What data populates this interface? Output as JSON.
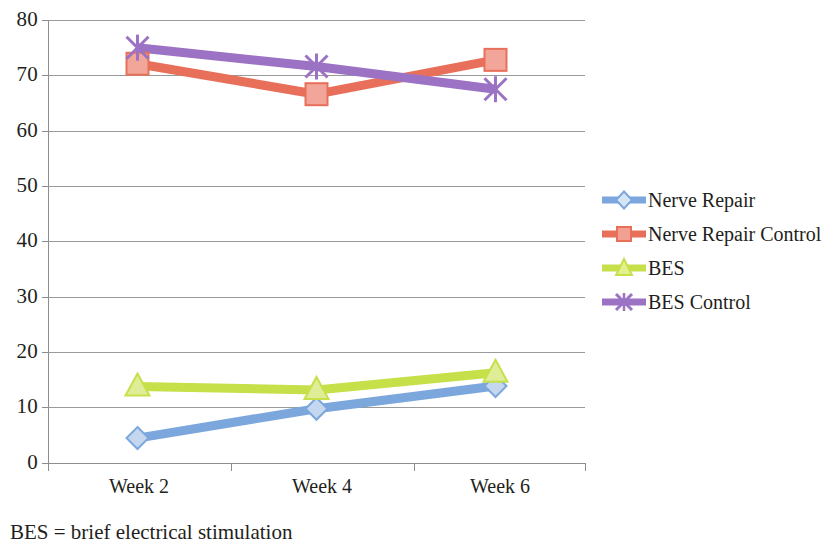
{
  "chart_data": {
    "type": "line",
    "title": "",
    "xlabel": "",
    "ylabel": "",
    "categories": [
      "Week 2",
      "Week 4",
      "Week 6"
    ],
    "ylim": [
      0,
      80
    ],
    "y_ticks": [
      0,
      10,
      20,
      30,
      40,
      50,
      60,
      70,
      80
    ],
    "grid": "horizontal",
    "legend_position": "right",
    "series": [
      {
        "name": "Nerve Repair",
        "marker": "diamond",
        "color": "#7BA7DC",
        "values": [
          4.5,
          9.8,
          13.9
        ]
      },
      {
        "name": "Nerve Repair Control",
        "marker": "square",
        "color": "#E8705A",
        "values": [
          72.1,
          66.6,
          72.8
        ]
      },
      {
        "name": "BES",
        "marker": "triangle",
        "color": "#C6E04A",
        "values": [
          13.8,
          13.2,
          16.3
        ]
      },
      {
        "name": "BES Control",
        "marker": "cross",
        "color": "#9B72C4",
        "values": [
          75.0,
          71.6,
          67.5
        ]
      }
    ],
    "annotations": [
      "BES = brief electrical stimulation"
    ]
  },
  "axes": {
    "y_tick_labels": [
      "80",
      "70",
      "60",
      "50",
      "40",
      "30",
      "20",
      "10",
      "0"
    ],
    "x_tick_labels": [
      "Week 2",
      "Week 4",
      "Week 6"
    ]
  },
  "legend": {
    "items": [
      {
        "label": "Nerve Repair",
        "color": "#7BA7DC",
        "marker": "diamond"
      },
      {
        "label": "Nerve Repair Control",
        "color": "#E8705A",
        "marker": "square"
      },
      {
        "label": "BES",
        "color": "#C6E04A",
        "marker": "triangle"
      },
      {
        "label": "BES Control",
        "color": "#9B72C4",
        "marker": "cross"
      }
    ]
  },
  "caption": {
    "text": "BES = brief electrical stimulation"
  }
}
